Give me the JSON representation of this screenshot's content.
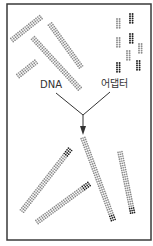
{
  "diagram": {
    "title": "",
    "labels": {
      "dna": "DNA",
      "adapter": "어댑터"
    },
    "colors": {
      "frame": "#3a3a3a",
      "strand_light": "#8c8c8c",
      "strand_dark": "#1e1e1e",
      "line": "#333333",
      "text": "#333333"
    },
    "frame": {
      "x": 7,
      "y": 4,
      "w": 144,
      "h": 236
    },
    "top_fragments": [
      {
        "x1": 12,
        "y1": 40,
        "x2": 41,
        "y2": 17
      },
      {
        "x1": 50,
        "y1": 24,
        "x2": 81,
        "y2": 67
      },
      {
        "x1": 33,
        "y1": 38,
        "x2": 80,
        "y2": 89
      },
      {
        "x1": 18,
        "y1": 76,
        "x2": 37,
        "y2": 61
      }
    ],
    "adapters": [
      {
        "x": 116,
        "y": 18,
        "dark": false
      },
      {
        "x": 129,
        "y": 13,
        "dark": true
      },
      {
        "x": 116,
        "y": 37,
        "dark": false
      },
      {
        "x": 129,
        "y": 33,
        "dark": true
      },
      {
        "x": 138,
        "y": 43,
        "dark": false
      },
      {
        "x": 126,
        "y": 50,
        "dark": false
      },
      {
        "x": 116,
        "y": 62,
        "dark": true
      },
      {
        "x": 136,
        "y": 60,
        "dark": true
      }
    ],
    "connector": {
      "left_start": [
        56,
        93
      ],
      "right_start": [
        110,
        92
      ],
      "junction": [
        83,
        115
      ],
      "arrow_tip": [
        83,
        135
      ]
    },
    "ligated_products": [
      {
        "x1": 22,
        "y1": 211,
        "x2": 71,
        "y2": 148,
        "dark_end": "end"
      },
      {
        "x1": 37,
        "y1": 222,
        "x2": 89,
        "y2": 184,
        "dark_end": "end"
      },
      {
        "x1": 83,
        "y1": 138,
        "x2": 114,
        "y2": 222,
        "dark_end": "end"
      },
      {
        "x1": 120,
        "y1": 152,
        "x2": 133,
        "y2": 215,
        "dark_end": "end"
      }
    ]
  }
}
